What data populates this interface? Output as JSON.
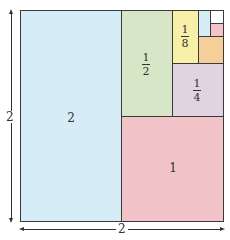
{
  "diagram": {
    "title": "",
    "outer_square": {
      "width_label": "2",
      "height_label": "2"
    },
    "regions": [
      {
        "name": "region-2",
        "label": "2",
        "color": "#d6ecf7"
      },
      {
        "name": "region-1",
        "label": "1",
        "color": "#f2c4c9"
      },
      {
        "name": "region-half",
        "numerator": "1",
        "denominator": "2",
        "color": "#d8e6c8"
      },
      {
        "name": "region-quarter",
        "numerator": "1",
        "denominator": "4",
        "color": "#e2d4df"
      },
      {
        "name": "region-eighth",
        "numerator": "1",
        "denominator": "8",
        "color": "#f8f0a8"
      },
      {
        "name": "region-sixteenth",
        "label": "",
        "color": "#f4cf9a"
      },
      {
        "name": "region-thirtysecond",
        "label": "",
        "color": "#d6ecf7"
      },
      {
        "name": "region-sixtyfourth",
        "label": "",
        "color": "#f2c4c9"
      },
      {
        "name": "region-remainder",
        "label": "",
        "color": "#ffffff"
      }
    ]
  }
}
